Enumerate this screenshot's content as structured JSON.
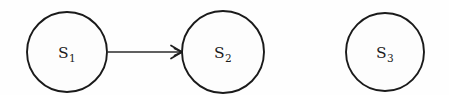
{
  "diagram": {
    "background_color": "#fefefe",
    "stroke_color": "#1a1a1a",
    "nodes": [
      {
        "id": "s1",
        "base": "S",
        "subscript": "1",
        "label": "S1",
        "cx": 67,
        "cy": 52,
        "r": 40
      },
      {
        "id": "s2",
        "base": "S",
        "subscript": "2",
        "label": "S2",
        "cx": 223,
        "cy": 52,
        "r": 41
      },
      {
        "id": "s3",
        "base": "S",
        "subscript": "3",
        "label": "S3",
        "cx": 385,
        "cy": 52,
        "r": 39
      }
    ],
    "edges": [
      {
        "id": "s1-to-s2",
        "from": "s1",
        "to": "s2",
        "label": "",
        "x1": 108,
        "y1": 52,
        "x2": 182,
        "y2": 52,
        "arrowhead": "open-barb"
      }
    ]
  }
}
